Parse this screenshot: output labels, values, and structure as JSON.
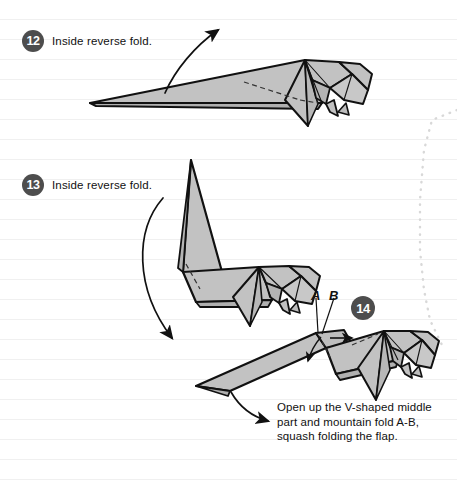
{
  "page": {
    "width": 457,
    "height": 481,
    "background_color": "#ffffff",
    "rule_line_color": "#f0f0f0",
    "paper_fill": "#c2c2c2",
    "paper_fill_shade": "#b0b0b0",
    "outline_color": "#111111",
    "badge_color": "#4d4d4d",
    "badge_text_color": "#ffffff",
    "dotted_edge_color": "#d6d6d6"
  },
  "steps": [
    {
      "number": "12",
      "label": "Inside reverse fold.",
      "badge_x": 22,
      "badge_y": 30,
      "arrow": "curved-up-right"
    },
    {
      "number": "13",
      "label": "Inside reverse fold.",
      "badge_x": 22,
      "badge_y": 174,
      "arrow": "curved-down-left"
    },
    {
      "number": "14",
      "label": "",
      "badge_x": 351,
      "badge_y": 296,
      "arrow": "curved-down-right"
    }
  ],
  "point_labels": [
    {
      "text": "A",
      "x": 314,
      "y": 291
    },
    {
      "text": "B",
      "x": 332,
      "y": 291
    }
  ],
  "caption": {
    "x": 277,
    "y": 400,
    "lines": [
      "Open up the V-shaped middle",
      "part and mountain fold A-B,",
      "squash folding the flap."
    ]
  },
  "figures": [
    {
      "name": "origami-figure-step-12",
      "description": "Long tapered paper form with detailed folded head at right"
    },
    {
      "name": "origami-figure-step-13",
      "description": "Form with tail flap reverse-folded upward at steep angle"
    },
    {
      "name": "origami-figure-step-14",
      "description": "Form with tail lowered, V-shaped middle, marked points A and B"
    }
  ]
}
